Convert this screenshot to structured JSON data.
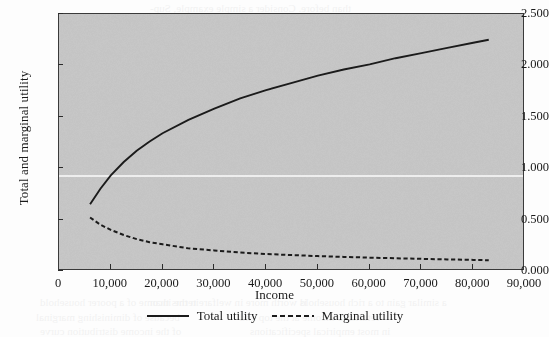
{
  "chart_data": {
    "type": "line",
    "title": "",
    "xlabel": "Income",
    "ylabel": "Total and marginal utility",
    "xlim": [
      0,
      90000
    ],
    "ylim": [
      0.0,
      2.5
    ],
    "grid": "single white horizontal rule near 0.94",
    "legend_position": "below-axis-center",
    "xticks": [
      "0",
      "10,000",
      "20,000",
      "30,000",
      "40,000",
      "50,000",
      "60,000",
      "70,000",
      "80,000",
      "90,000"
    ],
    "xtick_values": [
      0,
      10000,
      20000,
      30000,
      40000,
      50000,
      60000,
      70000,
      80000,
      90000
    ],
    "yticks": [
      "0.000",
      "0.500",
      "1.000",
      "1.500",
      "2.000",
      "2.500"
    ],
    "ytick_values": [
      0.0,
      0.5,
      1.0,
      1.5,
      2.0,
      2.5
    ],
    "x": [
      6000,
      8000,
      10000,
      12500,
      15000,
      17500,
      20000,
      25000,
      30000,
      35000,
      40000,
      45000,
      50000,
      55000,
      60000,
      65000,
      70000,
      75000,
      80000,
      83000
    ],
    "series": [
      {
        "name": "Total utility",
        "style": "solid",
        "color": "#1b1b1b",
        "values": [
          0.65,
          0.8,
          0.93,
          1.06,
          1.17,
          1.26,
          1.34,
          1.47,
          1.58,
          1.68,
          1.76,
          1.83,
          1.9,
          1.96,
          2.01,
          2.07,
          2.12,
          2.17,
          2.22,
          2.25
        ]
      },
      {
        "name": "Marginal utility",
        "style": "dashed",
        "color": "#1b1b1b",
        "values": [
          0.52,
          0.45,
          0.4,
          0.35,
          0.31,
          0.28,
          0.26,
          0.22,
          0.2,
          0.18,
          0.165,
          0.155,
          0.145,
          0.137,
          0.13,
          0.124,
          0.118,
          0.113,
          0.108,
          0.105
        ]
      }
    ]
  },
  "legend": {
    "entries": [
      {
        "label": "Total utility",
        "style": "solid"
      },
      {
        "label": "Marginal utility",
        "style": "dashed"
      }
    ]
  },
  "colors": {
    "plot_background": "#c9c9c9",
    "page_background": "#fdfdfd",
    "axis": "#2b2b2b",
    "line": "#1b1b1b",
    "gridline": "#f4f4f4"
  },
  "bleed_text": [
    {
      "t": "than before. Consider a simple example, Sup-",
      "x": 150,
      "y": 2
    },
    {
      "t": "pose utility is the logarithm of income and",
      "x": 168,
      "y": 14
    },
    {
      "t": "there are two people, one with an income of",
      "x": 150,
      "y": 27
    },
    {
      "t": "the average of their utilities. If we transfer",
      "x": 166,
      "y": 40
    },
    {
      "t": "income from the rich to the poor, the sum",
      "x": 158,
      "y": 53
    },
    {
      "t": "of utilities rises, because the gain to the",
      "x": 170,
      "y": 66
    },
    {
      "t": "poorer person exceeds the loss to the richer",
      "x": 152,
      "y": 79
    },
    {
      "t": "one. The marginal utility of income falls as",
      "x": 160,
      "y": 92
    },
    {
      "t": "income rises, so redistribution raises total",
      "x": 166,
      "y": 105
    },
    {
      "t": "welfare under a utilitarian social welfare",
      "x": 158,
      "y": 118
    },
    {
      "t": "function. This is the classic argument for",
      "x": 150,
      "y": 131
    },
    {
      "t": "progressive taxation in welfare economics",
      "x": 164,
      "y": 144
    },
    {
      "t": "and redistribution of income across house-",
      "x": 152,
      "y": 157
    },
    {
      "t": "holds, subject to incentive constraints that",
      "x": 160,
      "y": 170
    },
    {
      "t": "limit how far such transfers may go before",
      "x": 156,
      "y": 183
    },
    {
      "t": "labour supply responses erode the base.",
      "x": 168,
      "y": 196
    },
    {
      "t": "The figure below plots both total and",
      "x": 170,
      "y": 209
    },
    {
      "t": "marginal utility against income over the",
      "x": 162,
      "y": 222
    },
    {
      "t": "relevant range of the distribution shown.",
      "x": 158,
      "y": 235
    },
    {
      "t": "in the income of a poorer household",
      "x": 40,
      "y": 296
    },
    {
      "t": "is worth more in welfare terms than",
      "x": 150,
      "y": 296
    },
    {
      "t": "a similar gain to a rich household",
      "x": 300,
      "y": 296
    },
    {
      "t": "because of diminishing marginal",
      "x": 36,
      "y": 311
    },
    {
      "t": "returns to income at the top end",
      "x": 240,
      "y": 311
    },
    {
      "t": "of the income distribution curve",
      "x": 40,
      "y": 325
    },
    {
      "t": "in most empirical specifications",
      "x": 250,
      "y": 325
    }
  ]
}
